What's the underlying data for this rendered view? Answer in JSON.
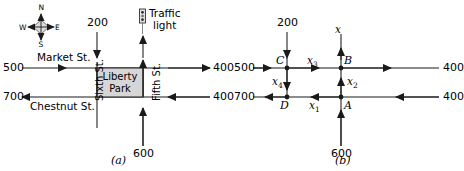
{
  "figure": {
    "panels": [
      {
        "id": "a",
        "caption": "(a)",
        "compass": {
          "north": "N",
          "east": "E",
          "south": "S",
          "west": "W",
          "fill": "#dcdcdc"
        },
        "traffic_light": {
          "label_line1": "Traffic",
          "label_line2": "light"
        },
        "park": {
          "name_line1": "Liberty",
          "name_line2": "Park",
          "fill": "#d6d6d6"
        },
        "streets": {
          "market": "Market St.",
          "chestnut": "Chestnut St.",
          "sixth": "Sixth St.",
          "fifth": "Fifth St."
        },
        "flows": {
          "top_in": "200",
          "left_in_market": "500",
          "left_out_chestnut": "700",
          "right_out_market": "400",
          "right_in_chestnut": "400",
          "bottom_in": "600"
        }
      },
      {
        "id": "b",
        "caption": "(b)",
        "nodes": {
          "a": "A",
          "b": "B",
          "c": "C",
          "d": "D"
        },
        "variables": {
          "x1": "x",
          "x1sub": "1",
          "x2": "x",
          "x2sub": "2",
          "x3": "x",
          "x3sub": "3",
          "x4": "x",
          "x4sub": "4",
          "x": "x"
        },
        "flows": {
          "top_in": "200",
          "left_in_top": "500",
          "left_out_bottom": "700",
          "right_out_top": "400",
          "right_in_bottom": "400",
          "bottom_in": "600"
        }
      }
    ]
  },
  "colors": {
    "line": "#1a1a1a",
    "park_fill": "#d6d6d6",
    "compass_fill": "#dcdcdc"
  }
}
